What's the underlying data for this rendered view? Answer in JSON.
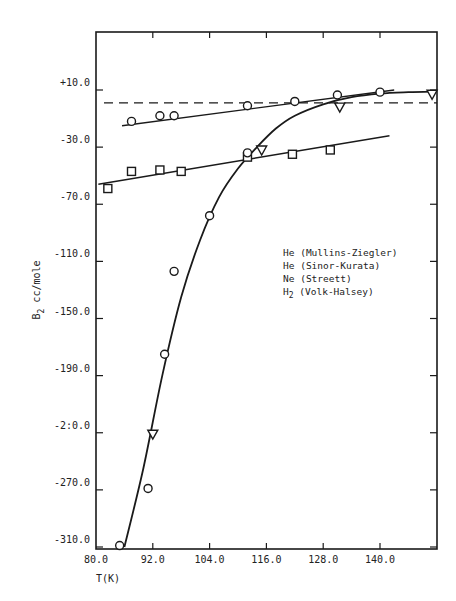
{
  "chart_data": {
    "type": "scatter",
    "title": "",
    "xlabel": "T(K)",
    "ylabel": "B2* cc/mole",
    "ylabel_parts": {
      "main": "B",
      "sub": "2",
      "sup": "*",
      "rest": " cc/mole"
    },
    "xlim": [
      80.0,
      152.0
    ],
    "ylim": [
      -310.0,
      37.0
    ],
    "x_ticks": [
      80.0,
      92.0,
      104.0,
      116.0,
      128.0,
      140.0
    ],
    "x_tick_labels": [
      "80.0",
      "92.0",
      "104.0",
      "116.0",
      "128.0",
      "140.0"
    ],
    "y_ticks": [
      10.0,
      -30.0,
      -70.0,
      -110.0,
      -150.0,
      -190.0,
      -230.0,
      -270.0,
      -310.0
    ],
    "y_tick_labels": [
      "+10.0",
      "-30.0",
      "-70.0",
      "-110.0",
      "-150.0",
      "-190.0",
      "-2:0.0",
      "-270.0",
      "-310.0"
    ],
    "grid": false,
    "reference_line": {
      "style": "dashed",
      "y": 1.0
    },
    "legend": {
      "position": "center-right",
      "entries": [
        {
          "label": "He (Mullins-Ziegler)",
          "marker": "hexagon-circle"
        },
        {
          "label": "He (Sinor-Kurata)",
          "marker": "circle"
        },
        {
          "label": "Ne (Streett)",
          "marker": "square"
        },
        {
          "label_main": "H",
          "label_sub": "2",
          "label_rest": " (Volk-Halsey)",
          "label": "H2 (Volk-Halsey)",
          "marker": "triangle-down"
        }
      ]
    },
    "series": [
      {
        "name": "He (Mullins-Ziegler)",
        "marker": "hexagon-circle",
        "points": [
          [
            87.5,
            -12.0
          ],
          [
            93.5,
            -8.0
          ],
          [
            96.5,
            -8.0
          ],
          [
            112.0,
            -1.0
          ],
          [
            122.0,
            2.0
          ],
          [
            131.0,
            6.5
          ],
          [
            140.0,
            8.5
          ]
        ],
        "fit_line": [
          [
            85.5,
            -15.0
          ],
          [
            143.0,
            10.0
          ]
        ]
      },
      {
        "name": "Ne (Streett)",
        "marker": "square",
        "points": [
          [
            82.5,
            -59.0
          ],
          [
            87.5,
            -47.0
          ],
          [
            93.5,
            -46.0
          ],
          [
            98.0,
            -47.0
          ],
          [
            112.0,
            -37.0
          ],
          [
            121.5,
            -35.0
          ],
          [
            129.5,
            -32.0
          ]
        ],
        "fit_line": [
          [
            80.5,
            -56.0
          ],
          [
            142.0,
            -22.0
          ]
        ]
      },
      {
        "name": "He (Sinor-Kurata)",
        "marker": "circle",
        "points": [
          [
            85.0,
            -309.0
          ],
          [
            91.0,
            -269.0
          ],
          [
            94.5,
            -175.0
          ],
          [
            96.5,
            -117.0
          ],
          [
            104.0,
            -78.0
          ],
          [
            112.0,
            -34.0
          ]
        ]
      },
      {
        "name": "H2 (Volk-Halsey)",
        "marker": "triangle-down",
        "points": [
          [
            92.0,
            -231.0
          ],
          [
            115.0,
            -32.0
          ],
          [
            131.5,
            -2.0
          ],
          [
            151.0,
            7.0
          ]
        ]
      },
      {
        "name": "H2 fitted curve",
        "type": "line",
        "points": [
          [
            86.0,
            -310.0
          ],
          [
            90.0,
            -255.0
          ],
          [
            94.0,
            -190.0
          ],
          [
            98.0,
            -135.0
          ],
          [
            102.0,
            -95.0
          ],
          [
            106.0,
            -65.0
          ],
          [
            110.0,
            -45.0
          ],
          [
            114.0,
            -30.0
          ],
          [
            118.0,
            -17.0
          ],
          [
            122.0,
            -8.0
          ],
          [
            128.0,
            0.0
          ],
          [
            134.0,
            5.0
          ],
          [
            140.0,
            7.5
          ],
          [
            146.0,
            8.5
          ],
          [
            152.0,
            9.0
          ]
        ]
      }
    ]
  }
}
